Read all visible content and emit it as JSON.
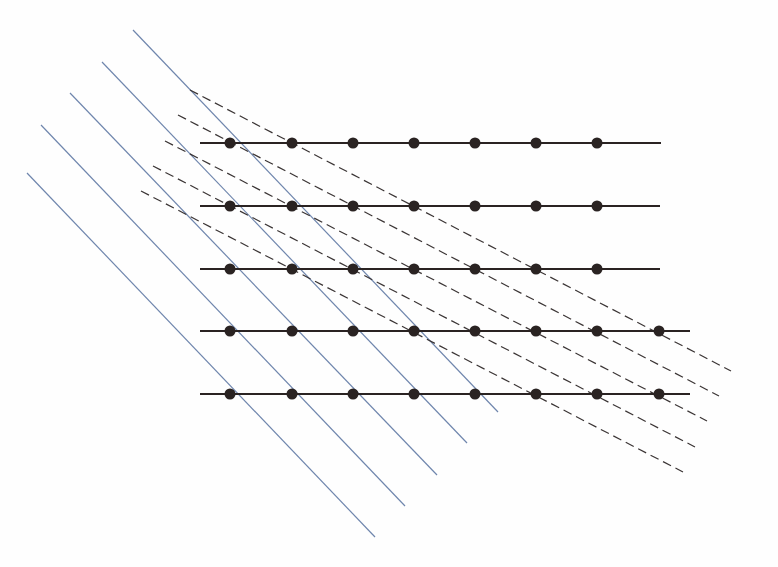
{
  "diagram": {
    "width": 778,
    "height": 567,
    "background": "#fefefe",
    "colors": {
      "row_line": "#2a2322",
      "dot": "#2a2322",
      "dashed_line": "#3a3434",
      "blue_line": "#6f86ad"
    },
    "dot_radius": 5.5,
    "rows": [
      {
        "y": 143,
        "x_start": 200,
        "x_end": 661,
        "dots_x": [
          230,
          292,
          353,
          414,
          475,
          536,
          597
        ]
      },
      {
        "y": 206,
        "x_start": 200,
        "x_end": 660,
        "dots_x": [
          230,
          292,
          353,
          414,
          475,
          536,
          597
        ]
      },
      {
        "y": 269,
        "x_start": 200,
        "x_end": 660,
        "dots_x": [
          230,
          292,
          353,
          414,
          475,
          536,
          597
        ]
      },
      {
        "y": 331,
        "x_start": 200,
        "x_end": 690,
        "dots_x": [
          230,
          292,
          353,
          414,
          475,
          536,
          597,
          659
        ]
      },
      {
        "y": 394,
        "x_start": 200,
        "x_end": 690,
        "dots_x": [
          230,
          292,
          353,
          414,
          475,
          536,
          597,
          659
        ]
      }
    ],
    "dashed_lines": [
      {
        "x1": 190,
        "y1": 90,
        "x2": 731,
        "y2": 371
      },
      {
        "x1": 178,
        "y1": 115,
        "x2": 719,
        "y2": 396
      },
      {
        "x1": 165,
        "y1": 141,
        "x2": 707,
        "y2": 421
      },
      {
        "x1": 153,
        "y1": 166,
        "x2": 695,
        "y2": 447
      },
      {
        "x1": 141,
        "y1": 191,
        "x2": 683,
        "y2": 472
      }
    ],
    "blue_lines": [
      {
        "x1": 133,
        "y1": 30,
        "x2": 498,
        "y2": 412
      },
      {
        "x1": 102,
        "y1": 62,
        "x2": 467,
        "y2": 443
      },
      {
        "x1": 70,
        "y1": 93,
        "x2": 437,
        "y2": 475
      },
      {
        "x1": 41,
        "y1": 125,
        "x2": 405,
        "y2": 506
      },
      {
        "x1": 27,
        "y1": 173,
        "x2": 375,
        "y2": 537
      }
    ]
  }
}
